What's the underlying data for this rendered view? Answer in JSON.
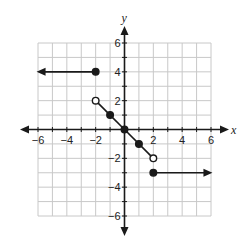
{
  "chart_data": {
    "type": "line",
    "title": "",
    "xlabel": "x",
    "ylabel": "y",
    "xlim": [
      -6,
      6
    ],
    "ylim": [
      -6,
      6
    ],
    "grid": true,
    "x_ticks": [
      -6,
      -4,
      -2,
      2,
      4,
      6
    ],
    "y_ticks": [
      6,
      4,
      2,
      -2,
      -4,
      -6
    ],
    "x_tick_labels": [
      "−6",
      "−4",
      "−2",
      "2",
      "4",
      "6"
    ],
    "y_tick_labels": [
      "6",
      "4",
      "2",
      "−2",
      "−4",
      "−6"
    ],
    "series": [
      {
        "name": "left ray",
        "points": [
          [
            -2,
            4
          ],
          [
            -6,
            4
          ]
        ],
        "start_marker": "closed",
        "end": "arrow-left",
        "description": "y = 4 for x <= -2"
      },
      {
        "name": "middle segment",
        "points": [
          [
            -2,
            2
          ],
          [
            -1,
            1
          ],
          [
            0,
            0
          ],
          [
            1,
            -1
          ],
          [
            2,
            -2
          ]
        ],
        "start_marker": "open",
        "end_marker": "open",
        "interior_markers": [
          [
            -1,
            1
          ],
          [
            0,
            0
          ],
          [
            1,
            -1
          ]
        ],
        "description": "y = -x for -2 < x < 2"
      },
      {
        "name": "right ray",
        "points": [
          [
            2,
            -3
          ],
          [
            6,
            -3
          ]
        ],
        "start_marker": "closed",
        "end": "arrow-right",
        "description": "y = -3 for x >= 2"
      }
    ]
  },
  "axes": {
    "x_label": "x",
    "y_label": "y"
  },
  "colors": {
    "line": "#1a1a1a",
    "grid": "#c8c8c8",
    "axis": "#1a1a1a",
    "open_fill": "#ffffff"
  }
}
